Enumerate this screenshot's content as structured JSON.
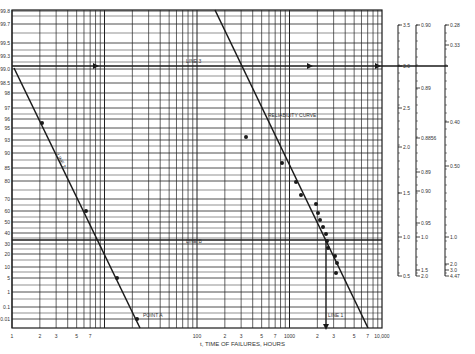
{
  "chart_data": {
    "type": "scatter",
    "xlabel": "t, TIME OF FAILURES, HOURS",
    "ylabel": "",
    "xscale": "log",
    "xlim": [
      1,
      10000
    ],
    "x_tick_labels": [
      {
        "v": 1,
        "label": "1"
      },
      {
        "v": 2,
        "label": "2"
      },
      {
        "v": 3,
        "label": "3"
      },
      {
        "v": 5,
        "label": "5"
      },
      {
        "v": 7,
        "label": "7"
      },
      {
        "v": 100,
        "label": "100"
      },
      {
        "v": 200,
        "label": "2"
      },
      {
        "v": 300,
        "label": "3"
      },
      {
        "v": 500,
        "label": "5"
      },
      {
        "v": 700,
        "label": "7"
      },
      {
        "v": 1000,
        "label": "1000"
      },
      {
        "v": 2000,
        "label": "2"
      },
      {
        "v": 3000,
        "label": "3"
      },
      {
        "v": 5000,
        "label": "5"
      },
      {
        "v": 7000,
        "label": "7"
      },
      {
        "v": 10000,
        "label": "10,000"
      }
    ],
    "y_tick_labels": [
      {
        "label": "99.8",
        "py": 11
      },
      {
        "label": "99.7",
        "py": 24
      },
      {
        "label": "99.5",
        "py": 43
      },
      {
        "label": "99.3",
        "py": 56
      },
      {
        "label": "99.0",
        "py": 69
      },
      {
        "label": "98.5",
        "py": 83
      },
      {
        "label": "98",
        "py": 93
      },
      {
        "label": "97",
        "py": 108
      },
      {
        "label": "96",
        "py": 119
      },
      {
        "label": "95",
        "py": 128
      },
      {
        "label": "93",
        "py": 140
      },
      {
        "label": "90",
        "py": 153
      },
      {
        "label": "85",
        "py": 168
      },
      {
        "label": "80",
        "py": 181
      },
      {
        "label": "70",
        "py": 199
      },
      {
        "label": "60",
        "py": 211
      },
      {
        "label": "50",
        "py": 222
      },
      {
        "label": "40",
        "py": 233
      },
      {
        "label": "30",
        "py": 244
      },
      {
        "label": "20",
        "py": 254
      },
      {
        "label": "10",
        "py": 267
      },
      {
        "label": "5",
        "py": 278
      },
      {
        "label": "1",
        "py": 292
      },
      {
        "label": "0.1",
        "py": 307
      },
      {
        "label": "0.01",
        "py": 319
      }
    ],
    "series": [
      {
        "name": "LINE 2",
        "type": "line",
        "points": [
          {
            "px": 14,
            "py": 68
          },
          {
            "px": 140,
            "py": 328
          }
        ]
      },
      {
        "name": "RELIABILITY CURVE",
        "type": "line",
        "points": [
          {
            "px": 215,
            "py": 10
          },
          {
            "px": 368,
            "py": 328
          }
        ]
      },
      {
        "name": "LINE 3",
        "type": "hline",
        "py": 66,
        "from_px": 12,
        "to_px": 448
      },
      {
        "name": "LINE B",
        "type": "hline",
        "py": 240,
        "from_px": 12,
        "to_px": 382
      },
      {
        "name": "LINE 1",
        "type": "vline",
        "px": 326,
        "from_py": 240,
        "to_py": 326
      },
      {
        "name": "Line 2 markers",
        "type": "scatter",
        "points": [
          {
            "px": 42,
            "py": 123
          },
          {
            "px": 86,
            "py": 211
          },
          {
            "px": 117,
            "py": 278
          },
          {
            "px": 137,
            "py": 319
          }
        ]
      },
      {
        "name": "Failure data",
        "type": "scatter",
        "points": [
          {
            "px": 246,
            "py": 137
          },
          {
            "px": 282,
            "py": 163
          },
          {
            "px": 296,
            "py": 182
          },
          {
            "px": 301,
            "py": 195
          },
          {
            "px": 316,
            "py": 204
          },
          {
            "px": 318,
            "py": 213
          },
          {
            "px": 320,
            "py": 220
          },
          {
            "px": 323,
            "py": 227
          },
          {
            "px": 326,
            "py": 234
          },
          {
            "px": 327,
            "py": 241
          },
          {
            "px": 328,
            "py": 248
          },
          {
            "px": 335,
            "py": 256
          },
          {
            "px": 337,
            "py": 263
          },
          {
            "px": 336,
            "py": 273
          }
        ]
      }
    ],
    "annotations": [
      {
        "text": "LINE 3",
        "px": 186,
        "py": 63
      },
      {
        "text": "RELIABILITY CURVE",
        "px": 268,
        "py": 117
      },
      {
        "text": "LINE 2",
        "px": 56,
        "py": 155
      },
      {
        "text": "LINE B",
        "px": 186,
        "py": 243
      },
      {
        "text": "POINT A",
        "px": 143,
        "py": 317
      },
      {
        "text": "LINE 1",
        "px": 328,
        "py": 317
      }
    ],
    "side_scales": [
      {
        "name": "beta",
        "px": 398,
        "ticks": [
          {
            "label": "3.5",
            "py": 25
          },
          {
            "label": "3.0",
            "py": 66
          },
          {
            "label": "2.5",
            "py": 108
          },
          {
            "label": "2.0",
            "py": 147
          },
          {
            "label": "1.5",
            "py": 193
          },
          {
            "label": "1.0",
            "py": 237
          },
          {
            "label": "0.5",
            "py": 276
          }
        ]
      },
      {
        "name": "gamma-ratio",
        "px": 416,
        "ticks": [
          {
            "label": "0.90",
            "py": 25
          },
          {
            "label": "0.89",
            "py": 88
          },
          {
            "label": "0.8856",
            "py": 138
          },
          {
            "label": "0.89",
            "py": 172
          },
          {
            "label": "0.90",
            "py": 191
          },
          {
            "label": "0.95",
            "py": 223
          },
          {
            "label": "1.0",
            "py": 237
          },
          {
            "label": "1.5",
            "py": 270
          },
          {
            "label": "2.0",
            "py": 276
          }
        ]
      },
      {
        "name": "coef",
        "px": 445,
        "ticks": [
          {
            "label": "0.28",
            "py": 25
          },
          {
            "label": "0.33",
            "py": 45
          },
          {
            "label": "0.40",
            "py": 122
          },
          {
            "label": "0.50",
            "py": 166
          },
          {
            "label": "1.0",
            "py": 237
          },
          {
            "label": "2.0",
            "py": 264
          },
          {
            "label": "3.0",
            "py": 270
          },
          {
            "label": "4.47",
            "py": 276
          }
        ]
      }
    ],
    "colors": {
      "ink": "#1a1a1a",
      "grid": "#222222",
      "label": "#333333",
      "paper": "#ffffff"
    }
  }
}
